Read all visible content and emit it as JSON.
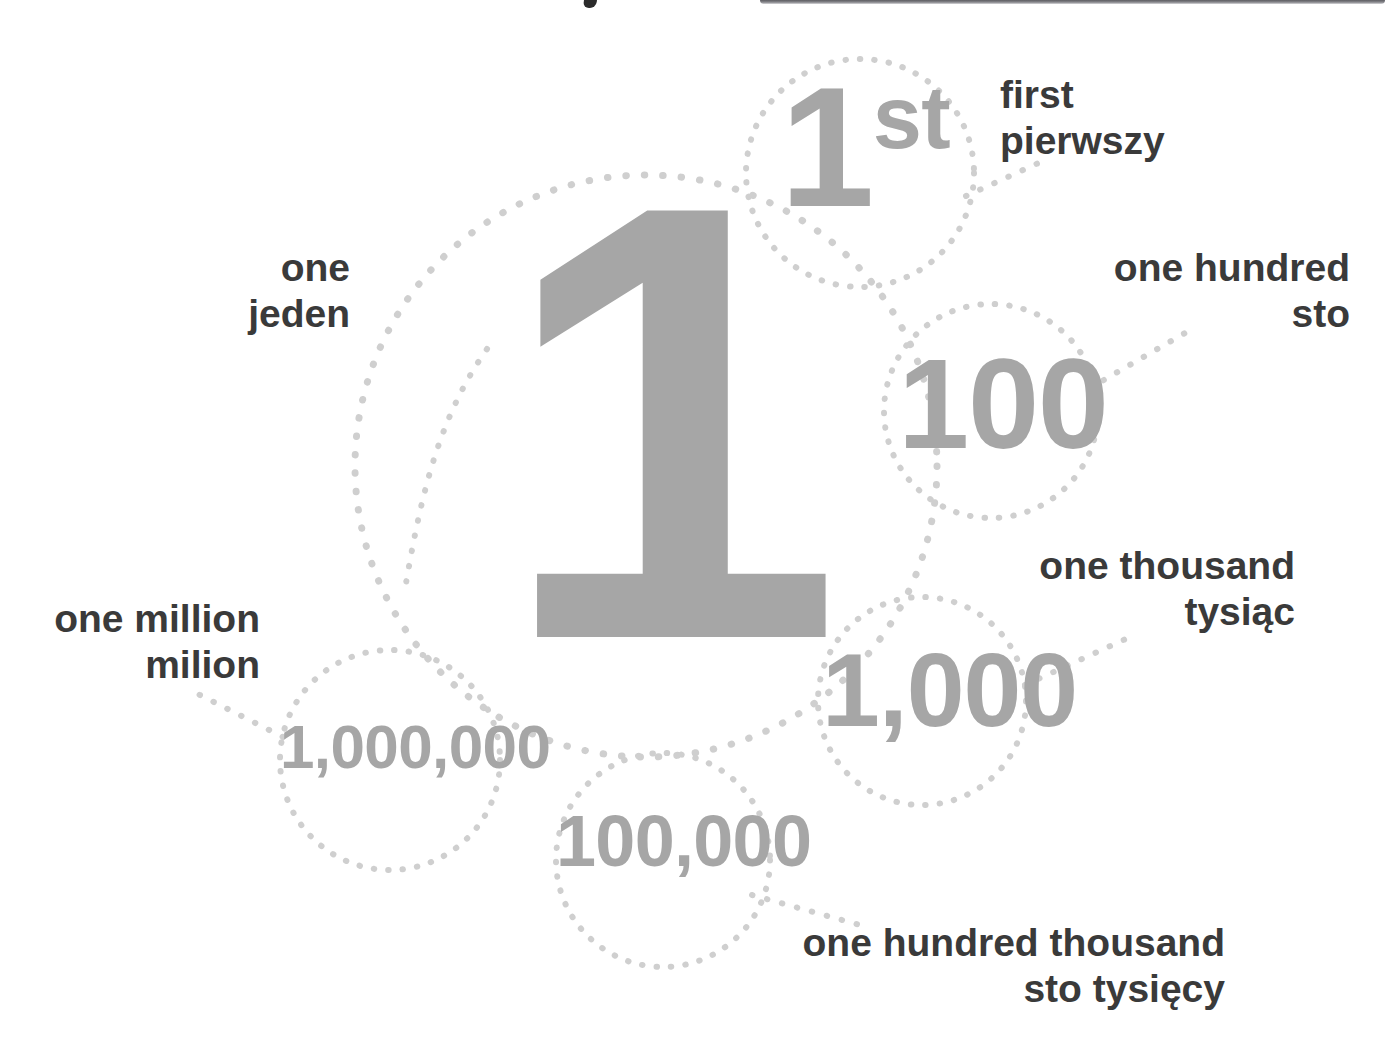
{
  "page": {
    "background_color": "#ffffff",
    "numeral_color": "#a6a6a6",
    "label_color": "#3a3a3a",
    "dot_color": "#cfcfcf",
    "title_crop_note": ""
  },
  "center": {
    "numeral": "1",
    "label_english": "one",
    "label_polish": "jeden"
  },
  "nodes": [
    {
      "id": "ordinal-first",
      "numeral": "1",
      "numeral_suffix": "st",
      "numeral_full": "1st",
      "label_english": "first",
      "label_polish": "pierwszy"
    },
    {
      "id": "one-hundred",
      "numeral": "100",
      "label_english": "one hundred",
      "label_polish": "sto"
    },
    {
      "id": "one-thousand",
      "numeral": "1,000",
      "label_english": "one thousand",
      "label_polish": "tysiąc"
    },
    {
      "id": "one-hundred-thousand",
      "numeral": "100,000",
      "label_english": "one hundred thousand",
      "label_polish": "sto tysięcy"
    },
    {
      "id": "one-million",
      "numeral": "1,000,000",
      "label_english": "one million",
      "label_polish": "milion"
    }
  ],
  "labels": {
    "one": "one\njeden",
    "first": "first\npierwszy",
    "one_hundred": "one hundred\nsto",
    "one_thousand": "one thousand\ntysiąc",
    "one_hundred_thousand": "one hundred thousand\nsto tysięcy",
    "one_million": "one million\nmilion"
  }
}
